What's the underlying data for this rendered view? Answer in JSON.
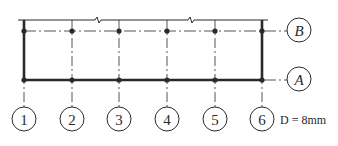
{
  "diagram": {
    "type": "structural grid axis plan",
    "colors": {
      "line": "#2a2a2a",
      "background": "#ffffff"
    },
    "vertical_axes": [
      {
        "label": "1",
        "x": 24
      },
      {
        "label": "2",
        "x": 72
      },
      {
        "label": "3",
        "x": 119
      },
      {
        "label": "4",
        "x": 167
      },
      {
        "label": "5",
        "x": 215
      },
      {
        "label": "6",
        "x": 262
      }
    ],
    "horizontal_axes": [
      {
        "label": "B",
        "y": 31
      },
      {
        "label": "A",
        "y": 80
      }
    ],
    "note": "D = 8mm"
  }
}
